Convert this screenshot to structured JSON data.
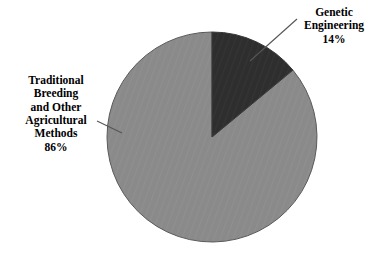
{
  "chart_data": {
    "type": "pie",
    "title": "",
    "categories": [
      "Genetic Engineering",
      "Traditional Breeding and Other Agricultural Methods"
    ],
    "values": [
      14,
      86
    ],
    "value_unit": "%",
    "start_angle_deg": 0,
    "direction": "clockwise",
    "legend_position": "none",
    "labels_position": "outside-with-leader-lines",
    "grid": false,
    "slices": [
      {
        "name": "Genetic Engineering",
        "value": 14,
        "value_label": "14%",
        "color": "#2e2e2e",
        "label_lines": [
          "Genetic",
          "Engineering",
          "14%"
        ]
      },
      {
        "name": "Traditional Breeding and Other Agricultural Methods",
        "value": 86,
        "value_label": "86%",
        "color": "#8a8a8a",
        "label_lines": [
          "Traditional",
          "Breeding",
          "and Other",
          "Agricultural",
          "Methods",
          "86%"
        ]
      }
    ]
  },
  "colors": {
    "background": "#ffffff",
    "slice_dark": "#2e2e2e",
    "slice_light": "#8a8a8a",
    "outline": "#4a4a4a",
    "leader_line": "#555555",
    "text": "#000000"
  },
  "labels": {
    "genetic": {
      "line1": "Genetic",
      "line2": "Engineering",
      "line3": "14%"
    },
    "traditional": {
      "line1": "Traditional",
      "line2": "Breeding",
      "line3": "and Other",
      "line4": "Agricultural",
      "line5": "Methods",
      "line6": "86%"
    }
  }
}
